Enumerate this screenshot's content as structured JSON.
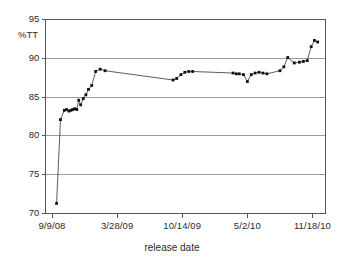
{
  "chart_data": {
    "type": "line",
    "title": "",
    "xlabel": "release date",
    "ylabel": "%TT",
    "ylim": [
      70,
      95
    ],
    "y_ticks": [
      70,
      75,
      80,
      85,
      90,
      95
    ],
    "y_tick_labels": [
      "70",
      "75",
      "80",
      "85",
      "90",
      "95"
    ],
    "x_tick_labels": [
      "9/9/08",
      "3/28/09",
      "10/14/09",
      "5/2/10",
      "11/18/10"
    ],
    "x_tick_positions": [
      0,
      200,
      400,
      600,
      800
    ],
    "xlim": [
      -20,
      840
    ],
    "grid": "horizontal",
    "legend": "none",
    "marker": "square",
    "line_color": "#333333",
    "marker_color": "#111111",
    "grid_color": "#9a9a9a",
    "axis_color": "#555555",
    "series": [
      {
        "name": "%TT",
        "x": [
          14,
          26,
          38,
          45,
          52,
          58,
          64,
          70,
          76,
          82,
          88,
          96,
          104,
          112,
          122,
          134,
          148,
          163,
          372,
          383,
          396,
          408,
          420,
          432,
          556,
          566,
          575,
          588,
          600,
          612,
          624,
          636,
          648,
          660,
          700,
          712,
          724,
          744,
          760,
          772,
          784,
          796,
          806,
          816
        ],
        "y": [
          71.3,
          82.1,
          83.3,
          83.4,
          83.2,
          83.3,
          83.4,
          83.5,
          83.4,
          84.6,
          84.0,
          84.8,
          85.3,
          86.0,
          86.5,
          88.3,
          88.6,
          88.4,
          87.2,
          87.4,
          87.9,
          88.2,
          88.3,
          88.3,
          88.1,
          88.0,
          88.0,
          87.9,
          87.0,
          87.9,
          88.1,
          88.2,
          88.1,
          88.0,
          88.4,
          88.9,
          90.1,
          89.4,
          89.5,
          89.6,
          89.7,
          91.5,
          92.3,
          92.1
        ]
      }
    ]
  }
}
